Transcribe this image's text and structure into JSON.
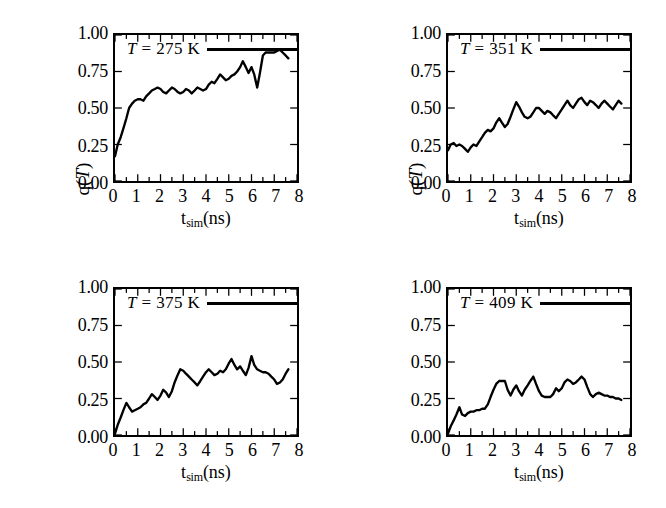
{
  "figure": {
    "panel_count": 4,
    "background": "#ffffff",
    "line_color": "#000000"
  },
  "axis": {
    "xlabel_main": "t",
    "xlabel_sub": "sim",
    "xlabel_unit": "(ns)",
    "ylabel_prefix": "q(",
    "ylabel_var": "T",
    "ylabel_suffix": ")",
    "xticks": [
      "0",
      "1",
      "2",
      "3",
      "4",
      "5",
      "6",
      "7",
      "8"
    ],
    "yticks": [
      "1.00",
      "0.75",
      "0.50",
      "0.25",
      "0.00"
    ]
  },
  "chart_data": [
    {
      "type": "line",
      "title": "T = 275 K",
      "legend": {
        "prefix": "T",
        "equals": " = ",
        "value": "275",
        "unit": "K"
      },
      "xlabel": "t_sim(ns)",
      "ylabel": "q(T)",
      "xlim": [
        0,
        8
      ],
      "ylim": [
        0,
        1
      ],
      "xticks": [
        0,
        1,
        2,
        3,
        4,
        5,
        6,
        7,
        8
      ],
      "yticks": [
        0.0,
        0.25,
        0.5,
        0.75,
        1.0
      ],
      "grid": false,
      "legend_position": "top-left-inside",
      "x": [
        0.0,
        0.12,
        0.25,
        0.37,
        0.5,
        0.62,
        0.75,
        0.87,
        1.0,
        1.12,
        1.25,
        1.37,
        1.5,
        1.62,
        1.75,
        1.87,
        2.0,
        2.12,
        2.25,
        2.37,
        2.5,
        2.62,
        2.75,
        2.87,
        3.0,
        3.12,
        3.25,
        3.37,
        3.5,
        3.62,
        3.75,
        3.87,
        4.0,
        4.12,
        4.25,
        4.37,
        4.5,
        4.62,
        4.75,
        4.87,
        5.0,
        5.12,
        5.25,
        5.37,
        5.5,
        5.62,
        5.75,
        5.87,
        6.0,
        6.12,
        6.25,
        6.37,
        6.5,
        6.62,
        6.75,
        6.87,
        7.0,
        7.12,
        7.25,
        7.37,
        7.5,
        7.62
      ],
      "y": [
        0.17,
        0.25,
        0.3,
        0.36,
        0.43,
        0.5,
        0.53,
        0.55,
        0.56,
        0.56,
        0.55,
        0.58,
        0.6,
        0.62,
        0.63,
        0.64,
        0.63,
        0.61,
        0.6,
        0.62,
        0.64,
        0.63,
        0.61,
        0.6,
        0.61,
        0.63,
        0.62,
        0.6,
        0.62,
        0.64,
        0.63,
        0.62,
        0.63,
        0.66,
        0.68,
        0.67,
        0.7,
        0.73,
        0.71,
        0.69,
        0.7,
        0.72,
        0.73,
        0.75,
        0.78,
        0.82,
        0.78,
        0.74,
        0.78,
        0.73,
        0.64,
        0.74,
        0.86,
        0.88,
        0.88,
        0.88,
        0.88,
        0.89,
        0.9,
        0.88,
        0.86,
        0.84
      ]
    },
    {
      "type": "line",
      "title": "T = 351 K",
      "legend": {
        "prefix": "T",
        "equals": " = ",
        "value": "351",
        "unit": "K"
      },
      "xlabel": "t_sim(ns)",
      "ylabel": "q(T)",
      "xlim": [
        0,
        8
      ],
      "ylim": [
        0,
        1
      ],
      "xticks": [
        0,
        1,
        2,
        3,
        4,
        5,
        6,
        7,
        8
      ],
      "yticks": [
        0.0,
        0.25,
        0.5,
        0.75,
        1.0
      ],
      "grid": false,
      "legend_position": "top-left-inside",
      "x": [
        0.0,
        0.12,
        0.25,
        0.37,
        0.5,
        0.62,
        0.75,
        0.87,
        1.0,
        1.12,
        1.25,
        1.37,
        1.5,
        1.62,
        1.75,
        1.87,
        2.0,
        2.12,
        2.25,
        2.37,
        2.5,
        2.62,
        2.75,
        2.87,
        3.0,
        3.12,
        3.25,
        3.37,
        3.5,
        3.62,
        3.75,
        3.87,
        4.0,
        4.12,
        4.25,
        4.37,
        4.5,
        4.62,
        4.75,
        4.87,
        5.0,
        5.12,
        5.25,
        5.37,
        5.5,
        5.62,
        5.75,
        5.87,
        6.0,
        6.12,
        6.25,
        6.37,
        6.5,
        6.62,
        6.75,
        6.87,
        7.0,
        7.12,
        7.25,
        7.37,
        7.5,
        7.62
      ],
      "y": [
        0.21,
        0.25,
        0.26,
        0.24,
        0.25,
        0.24,
        0.22,
        0.2,
        0.23,
        0.25,
        0.24,
        0.27,
        0.3,
        0.33,
        0.35,
        0.34,
        0.36,
        0.4,
        0.43,
        0.4,
        0.37,
        0.39,
        0.44,
        0.49,
        0.54,
        0.51,
        0.47,
        0.44,
        0.43,
        0.44,
        0.47,
        0.5,
        0.5,
        0.48,
        0.46,
        0.48,
        0.47,
        0.45,
        0.43,
        0.46,
        0.49,
        0.52,
        0.55,
        0.52,
        0.5,
        0.53,
        0.56,
        0.57,
        0.54,
        0.52,
        0.55,
        0.54,
        0.52,
        0.5,
        0.53,
        0.55,
        0.53,
        0.51,
        0.49,
        0.52,
        0.55,
        0.53
      ]
    },
    {
      "type": "line",
      "title": "T = 375 K",
      "legend": {
        "prefix": "T",
        "equals": " = ",
        "value": "375",
        "unit": "K"
      },
      "xlabel": "t_sim(ns)",
      "ylabel": "q(T)",
      "xlim": [
        0,
        8
      ],
      "ylim": [
        0,
        1
      ],
      "xticks": [
        0,
        1,
        2,
        3,
        4,
        5,
        6,
        7,
        8
      ],
      "yticks": [
        0.0,
        0.25,
        0.5,
        0.75,
        1.0
      ],
      "grid": false,
      "legend_position": "top-left-inside",
      "x": [
        0.0,
        0.12,
        0.25,
        0.37,
        0.5,
        0.62,
        0.75,
        0.87,
        1.0,
        1.12,
        1.25,
        1.37,
        1.5,
        1.62,
        1.75,
        1.87,
        2.0,
        2.12,
        2.25,
        2.37,
        2.5,
        2.62,
        2.75,
        2.87,
        3.0,
        3.12,
        3.25,
        3.37,
        3.5,
        3.62,
        3.75,
        3.87,
        4.0,
        4.12,
        4.25,
        4.37,
        4.5,
        4.62,
        4.75,
        4.87,
        5.0,
        5.12,
        5.25,
        5.37,
        5.5,
        5.62,
        5.75,
        5.87,
        6.0,
        6.12,
        6.25,
        6.37,
        6.5,
        6.62,
        6.75,
        6.87,
        7.0,
        7.12,
        7.25,
        7.37,
        7.5,
        7.62
      ],
      "y": [
        0.01,
        0.07,
        0.12,
        0.17,
        0.22,
        0.19,
        0.16,
        0.17,
        0.18,
        0.19,
        0.21,
        0.22,
        0.25,
        0.28,
        0.26,
        0.24,
        0.27,
        0.31,
        0.29,
        0.26,
        0.3,
        0.36,
        0.41,
        0.45,
        0.44,
        0.42,
        0.4,
        0.38,
        0.36,
        0.34,
        0.37,
        0.4,
        0.43,
        0.45,
        0.43,
        0.41,
        0.42,
        0.44,
        0.43,
        0.45,
        0.49,
        0.52,
        0.48,
        0.45,
        0.47,
        0.44,
        0.41,
        0.46,
        0.54,
        0.48,
        0.45,
        0.44,
        0.43,
        0.43,
        0.42,
        0.4,
        0.38,
        0.35,
        0.36,
        0.38,
        0.42,
        0.45
      ]
    },
    {
      "type": "line",
      "title": "T = 409 K",
      "legend": {
        "prefix": "T",
        "equals": " = ",
        "value": "409",
        "unit": "K"
      },
      "xlabel": "t_sim(ns)",
      "ylabel": "q(T)",
      "xlim": [
        0,
        8
      ],
      "ylim": [
        0,
        1
      ],
      "xticks": [
        0,
        1,
        2,
        3,
        4,
        5,
        6,
        7,
        8
      ],
      "yticks": [
        0.0,
        0.25,
        0.5,
        0.75,
        1.0
      ],
      "grid": false,
      "legend_position": "top-left-inside",
      "x": [
        0.0,
        0.12,
        0.25,
        0.37,
        0.5,
        0.62,
        0.75,
        0.87,
        1.0,
        1.12,
        1.25,
        1.37,
        1.5,
        1.62,
        1.75,
        1.87,
        2.0,
        2.12,
        2.25,
        2.37,
        2.5,
        2.62,
        2.75,
        2.87,
        3.0,
        3.12,
        3.25,
        3.37,
        3.5,
        3.62,
        3.75,
        3.87,
        4.0,
        4.12,
        4.25,
        4.37,
        4.5,
        4.62,
        4.75,
        4.87,
        5.0,
        5.12,
        5.25,
        5.37,
        5.5,
        5.62,
        5.75,
        5.87,
        6.0,
        6.12,
        6.25,
        6.37,
        6.5,
        6.62,
        6.75,
        6.87,
        7.0,
        7.12,
        7.25,
        7.37,
        7.5,
        7.62
      ],
      "y": [
        0.01,
        0.06,
        0.1,
        0.14,
        0.19,
        0.14,
        0.13,
        0.15,
        0.16,
        0.16,
        0.17,
        0.17,
        0.18,
        0.18,
        0.21,
        0.26,
        0.31,
        0.35,
        0.37,
        0.37,
        0.37,
        0.31,
        0.27,
        0.31,
        0.34,
        0.3,
        0.27,
        0.31,
        0.34,
        0.37,
        0.4,
        0.35,
        0.3,
        0.27,
        0.26,
        0.26,
        0.26,
        0.28,
        0.32,
        0.3,
        0.32,
        0.36,
        0.38,
        0.37,
        0.35,
        0.36,
        0.38,
        0.4,
        0.38,
        0.33,
        0.28,
        0.26,
        0.28,
        0.29,
        0.28,
        0.27,
        0.27,
        0.26,
        0.26,
        0.25,
        0.25,
        0.24
      ]
    }
  ]
}
